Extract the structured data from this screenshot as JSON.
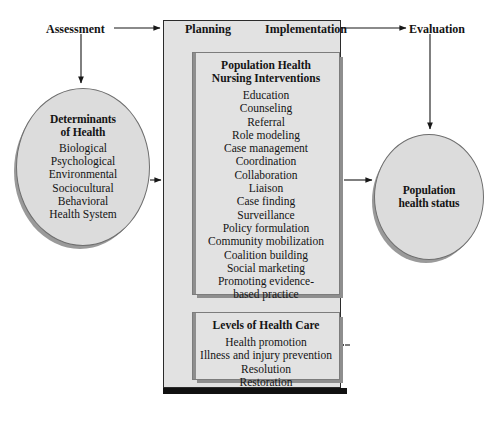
{
  "diagram": {
    "colors": {
      "fill_gray": "#dcdcdc",
      "panel_gray": "#e2e2e2",
      "outline": "#6e6e6e",
      "shadow": "#8e8e8e",
      "frame_black": "#111111",
      "text": "#141414",
      "background": "#ffffff"
    }
  },
  "stage_labels": {
    "assessment": "Assessment",
    "planning": "Planning",
    "implementation": "Implementation",
    "evaluation": "Evaluation"
  },
  "determinants": {
    "title_line1": "Determinants",
    "title_line2": "of Health",
    "items": [
      "Biological",
      "Psychological",
      "Environmental",
      "Sociocultural",
      "Behavioral",
      "Health System"
    ]
  },
  "interventions": {
    "title_line1": "Population Health",
    "title_line2": "Nursing Interventions",
    "items": [
      "Education",
      "Counseling",
      "Referral",
      "Role modeling",
      "Case management",
      "Coordination",
      "Collaboration",
      "Liaison",
      "Case finding",
      "Surveillance",
      "Policy formulation",
      "Community mobilization",
      "Coalition building",
      "Social marketing",
      "Promoting evidence-",
      "based practice"
    ]
  },
  "levels_of_care": {
    "title": "Levels of Health Care",
    "items": [
      "Health promotion",
      "Illness and injury prevention",
      "Resolution",
      "Restoration"
    ]
  },
  "outcome": {
    "title_line1": "Population",
    "title_line2": "health status"
  }
}
